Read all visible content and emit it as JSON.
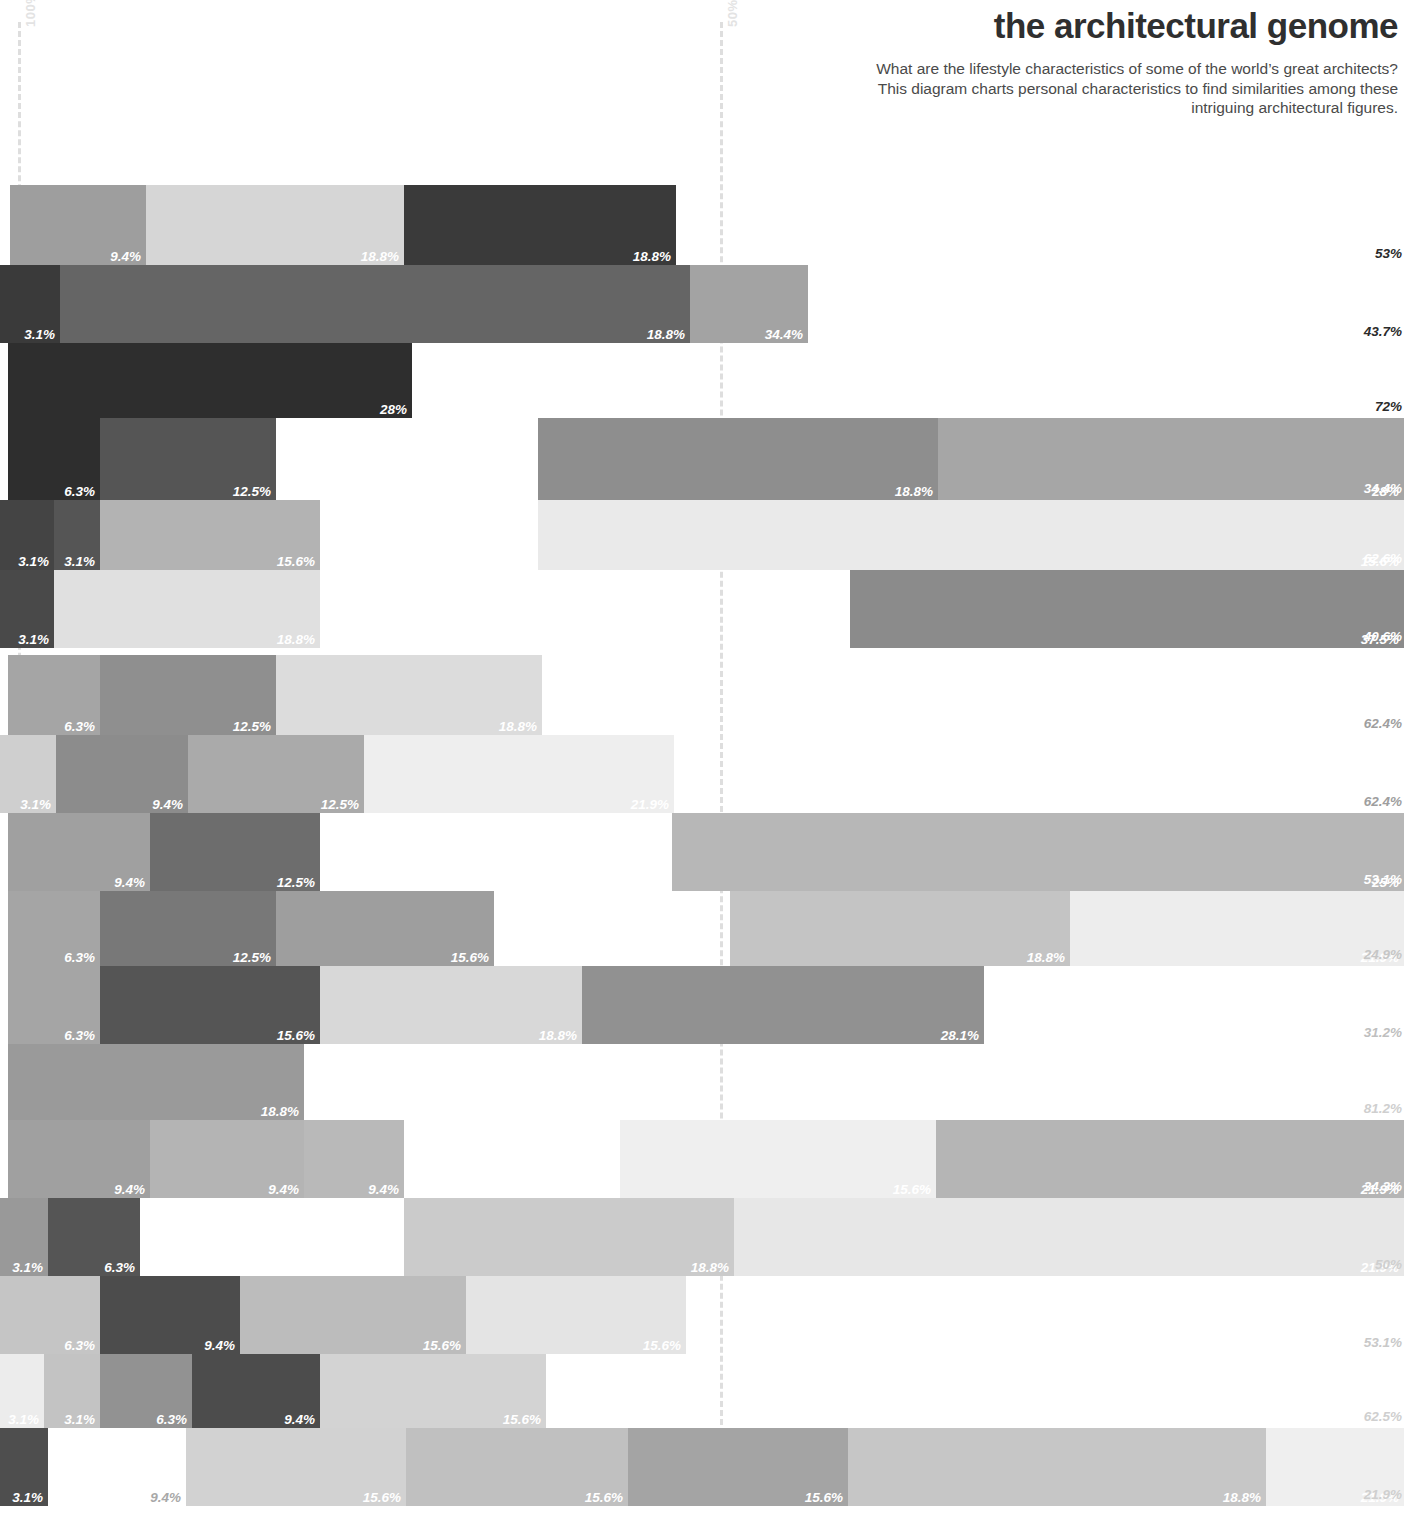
{
  "header": {
    "title": "the architectural genome",
    "subtitle": "What are the lifestyle characteristics of some of the world’s great architects? This diagram charts personal characteristics to find similarities among these intriguing architectural figures."
  },
  "axis": {
    "left_label": "100%",
    "mid_label": "50%"
  },
  "chart_data": {
    "type": "bar",
    "title": "the architectural genome",
    "subtitle": "What are the lifestyle characteristics of some of the world’s great architects? This diagram charts personal characteristics to find similarities among these intriguing architectural figures.",
    "xlabel": "",
    "ylabel": "",
    "xlim": [
      0,
      100
    ],
    "grid": true,
    "gridlines": [
      {
        "label": "100%",
        "value": 0,
        "px": 18
      },
      {
        "label": "50%",
        "value": 50,
        "px": 720
      }
    ],
    "legend_position": "none",
    "note": "Stacked horizontal bars. Each row is offset; x positions are pixel-measured. Segment labels are right-aligned percentages inside each segment; the rightmost value in the far-right column is the row total.",
    "rows": [
      {
        "index": 0,
        "top": 185,
        "height": 80,
        "total": "53%",
        "total_color": "#2b2b2b",
        "segments": [
          {
            "label": "9.4%",
            "x": 10,
            "w": 136,
            "color": "#9e9e9e",
            "label_color": "light"
          },
          {
            "label": "18.8%",
            "x": 146,
            "w": 258,
            "color": "#d6d6d6",
            "label_color": "light"
          },
          {
            "label": "18.8%",
            "x": 404,
            "w": 272,
            "color": "#3a3a3a",
            "label_color": "light"
          }
        ]
      },
      {
        "index": 1,
        "top": 265,
        "height": 78,
        "total": "43.7%",
        "total_color": "#2b2b2b",
        "segments": [
          {
            "label": "3.1%",
            "x": 0,
            "w": 60,
            "color": "#3a3a3a",
            "label_color": "light"
          },
          {
            "label": "18.8%",
            "x": 60,
            "w": 630,
            "color": "#656565",
            "label_color": "light"
          },
          {
            "label": "34.4%",
            "x": 690,
            "w": 118,
            "color": "#a3a3a3",
            "label_color": "light"
          }
        ]
      },
      {
        "index": 2,
        "top": 343,
        "height": 75,
        "total": "72%",
        "total_color": "#2b2b2b",
        "segments": [
          {
            "label": "28%",
            "x": 8,
            "w": 404,
            "color": "#2e2e2e",
            "label_color": "light"
          }
        ]
      },
      {
        "index": 3,
        "top": 418,
        "height": 82,
        "total": "34.4%",
        "total_color": "#ffffff",
        "segments": [
          {
            "label": "6.3%",
            "x": 8,
            "w": 92,
            "color": "#2e2e2e",
            "label_color": "light"
          },
          {
            "label": "12.5%",
            "x": 100,
            "w": 176,
            "color": "#555555",
            "label_color": "light"
          },
          {
            "label": "18.8%",
            "x": 538,
            "w": 400,
            "color": "#8e8e8e",
            "label_color": "light"
          },
          {
            "label": "28%",
            "x": 938,
            "w": 466,
            "color": "#a6a6a6",
            "label_color": "light"
          }
        ]
      },
      {
        "index": 4,
        "top": 500,
        "height": 70,
        "total": "62.6%",
        "total_color": "#ffffff",
        "segments": [
          {
            "label": "3.1%",
            "x": 0,
            "w": 54,
            "color": "#444444",
            "label_color": "light"
          },
          {
            "label": "3.1%",
            "x": 54,
            "w": 46,
            "color": "#555555",
            "label_color": "light"
          },
          {
            "label": "15.6%",
            "x": 100,
            "w": 220,
            "color": "#b3b3b3",
            "label_color": "light"
          },
          {
            "label": "15.6%",
            "x": 538,
            "w": 866,
            "color": "#eaeaea",
            "label_color": "light"
          }
        ]
      },
      {
        "index": 5,
        "top": 570,
        "height": 78,
        "total": "40.6%",
        "total_color": "#ffffff",
        "segments": [
          {
            "label": "3.1%",
            "x": 0,
            "w": 54,
            "color": "#494949",
            "label_color": "light"
          },
          {
            "label": "18.8%",
            "x": 54,
            "w": 266,
            "color": "#e0e0e0",
            "label_color": "light"
          },
          {
            "label": "37.5%",
            "x": 850,
            "w": 554,
            "color": "#8b8b8b",
            "label_color": "light"
          }
        ]
      },
      {
        "index": 6,
        "top": 655,
        "height": 80,
        "total": "62.4%",
        "total_color": "#9e9e9e",
        "segments": [
          {
            "label": "6.3%",
            "x": 8,
            "w": 92,
            "color": "#a5a5a5",
            "label_color": "light"
          },
          {
            "label": "12.5%",
            "x": 100,
            "w": 176,
            "color": "#8f8f8f",
            "label_color": "light"
          },
          {
            "label": "18.8%",
            "x": 276,
            "w": 266,
            "color": "#dcdcdc",
            "label_color": "light"
          }
        ]
      },
      {
        "index": 7,
        "top": 735,
        "height": 78,
        "total": "62.4%",
        "total_color": "#9e9e9e",
        "segments": [
          {
            "label": "3.1%",
            "x": 0,
            "w": 56,
            "color": "#cfcfcf",
            "label_color": "light"
          },
          {
            "label": "9.4%",
            "x": 56,
            "w": 132,
            "color": "#8c8c8c",
            "label_color": "light"
          },
          {
            "label": "12.5%",
            "x": 188,
            "w": 176,
            "color": "#aaaaaa",
            "label_color": "light"
          },
          {
            "label": "21.9%",
            "x": 364,
            "w": 310,
            "color": "#eeeeee",
            "label_color": "light"
          }
        ]
      },
      {
        "index": 8,
        "top": 813,
        "height": 78,
        "total": "53.1%",
        "total_color": "#ffffff",
        "segments": [
          {
            "label": "9.4%",
            "x": 8,
            "w": 142,
            "color": "#a0a0a0",
            "label_color": "light"
          },
          {
            "label": "12.5%",
            "x": 150,
            "w": 170,
            "color": "#6d6d6d",
            "label_color": "light"
          },
          {
            "label": "25%",
            "x": 672,
            "w": 732,
            "color": "#b7b7b7",
            "label_color": "light"
          }
        ]
      },
      {
        "index": 9,
        "top": 891,
        "height": 75,
        "total": "24.9%",
        "total_color": "#c6c6c6",
        "segments": [
          {
            "label": "6.3%",
            "x": 8,
            "w": 92,
            "color": "#a5a5a5",
            "label_color": "light"
          },
          {
            "label": "12.5%",
            "x": 100,
            "w": 176,
            "color": "#787878",
            "label_color": "light"
          },
          {
            "label": "15.6%",
            "x": 276,
            "w": 218,
            "color": "#9e9e9e",
            "label_color": "light"
          },
          {
            "label": "18.8%",
            "x": 730,
            "w": 340,
            "color": "#c4c4c4",
            "label_color": "light"
          },
          {
            "label": "21.9%",
            "x": 1070,
            "w": 334,
            "color": "#ededed",
            "label_color": "light"
          }
        ]
      },
      {
        "index": 10,
        "top": 966,
        "height": 78,
        "total": "31.2%",
        "total_color": "#bfbfbf",
        "segments": [
          {
            "label": "6.3%",
            "x": 8,
            "w": 92,
            "color": "#a5a5a5",
            "label_color": "light"
          },
          {
            "label": "15.6%",
            "x": 100,
            "w": 220,
            "color": "#555555",
            "label_color": "light"
          },
          {
            "label": "18.8%",
            "x": 320,
            "w": 262,
            "color": "#d8d8d8",
            "label_color": "light"
          },
          {
            "label": "28.1%",
            "x": 582,
            "w": 402,
            "color": "#919191",
            "label_color": "light"
          }
        ]
      },
      {
        "index": 11,
        "top": 1044,
        "height": 76,
        "total": "81.2%",
        "total_color": "#cfcfcf",
        "segments": [
          {
            "label": "18.8%",
            "x": 8,
            "w": 296,
            "color": "#9a9a9a",
            "label_color": "light"
          }
        ]
      },
      {
        "index": 12,
        "top": 1120,
        "height": 78,
        "total": "34.3%",
        "total_color": "#ffffff",
        "segments": [
          {
            "label": "9.4%",
            "x": 8,
            "w": 142,
            "color": "#a0a0a0",
            "label_color": "light"
          },
          {
            "label": "9.4%",
            "x": 150,
            "w": 154,
            "color": "#b4b4b4",
            "label_color": "light"
          },
          {
            "label": "9.4%",
            "x": 304,
            "w": 100,
            "color": "#b9b9b9",
            "label_color": "light"
          },
          {
            "label": "15.6%",
            "x": 620,
            "w": 316,
            "color": "#efefef",
            "label_color": "light"
          },
          {
            "label": "21.9%",
            "x": 936,
            "w": 468,
            "color": "#b5b5b5",
            "label_color": "light"
          }
        ]
      },
      {
        "index": 13,
        "top": 1198,
        "height": 78,
        "total": "50%",
        "total_color": "#cfcfcf",
        "segments": [
          {
            "label": "3.1%",
            "x": 0,
            "w": 48,
            "color": "#999999",
            "label_color": "light"
          },
          {
            "label": "6.3%",
            "x": 48,
            "w": 92,
            "color": "#555555",
            "label_color": "light"
          },
          {
            "label": "18.8%",
            "x": 404,
            "w": 330,
            "color": "#cbcbcb",
            "label_color": "light"
          },
          {
            "label": "21.9%",
            "x": 734,
            "w": 670,
            "color": "#e7e7e7",
            "label_color": "light"
          }
        ]
      },
      {
        "index": 14,
        "top": 1276,
        "height": 78,
        "total": "53.1%",
        "total_color": "#c9c9c9",
        "segments": [
          {
            "label": "6.3%",
            "x": 0,
            "w": 100,
            "color": "#c5c5c5",
            "label_color": "light"
          },
          {
            "label": "9.4%",
            "x": 100,
            "w": 140,
            "color": "#4c4c4c",
            "label_color": "light"
          },
          {
            "label": "15.6%",
            "x": 240,
            "w": 226,
            "color": "#bcbcbc",
            "label_color": "light"
          },
          {
            "label": "15.6%",
            "x": 466,
            "w": 220,
            "color": "#e4e4e4",
            "label_color": "light"
          }
        ]
      },
      {
        "index": 15,
        "top": 1354,
        "height": 74,
        "total": "62.5%",
        "total_color": "#cfcfcf",
        "segments": [
          {
            "label": "3.1%",
            "x": 0,
            "w": 44,
            "color": "#ececec",
            "label_color": "light"
          },
          {
            "label": "3.1%",
            "x": 44,
            "w": 56,
            "color": "#c3c3c3",
            "label_color": "light"
          },
          {
            "label": "6.3%",
            "x": 100,
            "w": 92,
            "color": "#929292",
            "label_color": "light"
          },
          {
            "label": "9.4%",
            "x": 192,
            "w": 128,
            "color": "#4c4c4c",
            "label_color": "light"
          },
          {
            "label": "15.6%",
            "x": 320,
            "w": 226,
            "color": "#d3d3d3",
            "label_color": "light"
          }
        ]
      },
      {
        "index": 16,
        "top": 1428,
        "height": 78,
        "total": "21.9%",
        "total_color": "#cfcfcf",
        "segments": [
          {
            "label": "3.1%",
            "x": 0,
            "w": 48,
            "color": "#4e4e4e",
            "label_color": "light"
          },
          {
            "label": "9.4%",
            "x": 48,
            "w": 138,
            "color": "#ffffff",
            "label_color": "dark"
          },
          {
            "label": "15.6%",
            "x": 186,
            "w": 220,
            "color": "#d2d2d2",
            "label_color": "light"
          },
          {
            "label": "15.6%",
            "x": 406,
            "w": 222,
            "color": "#c0c0c0",
            "label_color": "light"
          },
          {
            "label": "15.6%",
            "x": 628,
            "w": 220,
            "color": "#a4a4a4",
            "label_color": "light"
          },
          {
            "label": "18.8%",
            "x": 848,
            "w": 418,
            "color": "#c6c6c6",
            "label_color": "light"
          },
          {
            "label": "21.9%",
            "x": 1266,
            "w": 138,
            "color": "#efefef",
            "label_color": "light"
          }
        ]
      }
    ]
  }
}
